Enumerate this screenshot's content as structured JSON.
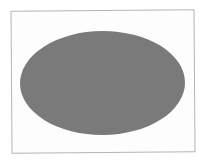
{
  "figure": {
    "shape": "ellipse",
    "fill_color": "#7a7a7a",
    "frame_border_color": "#b5b5b5",
    "background_color": "#ffffff"
  }
}
